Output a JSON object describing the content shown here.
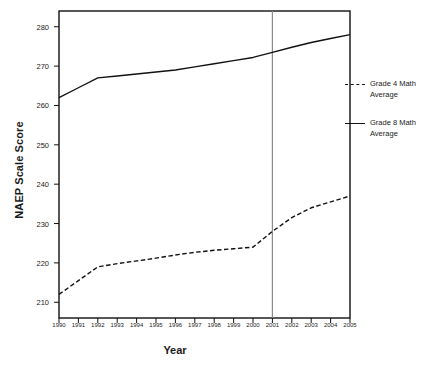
{
  "chart_data": {
    "type": "line",
    "title": "",
    "xlabel": "Year",
    "ylabel": "NAEP Scale Score",
    "x": [
      1990,
      1991,
      1992,
      1993,
      1994,
      1995,
      1996,
      1997,
      1998,
      1999,
      2000,
      2001,
      2002,
      2003,
      2004,
      2005
    ],
    "categories": [
      "1990",
      "1991",
      "1992",
      "1993",
      "1994",
      "1995",
      "1996",
      "1997",
      "1998",
      "1999",
      "2000",
      "2001",
      "2002",
      "2003",
      "2004",
      "2005"
    ],
    "xlim": [
      1990,
      2005
    ],
    "ylim": [
      206,
      284
    ],
    "yticks": [
      210,
      220,
      230,
      240,
      250,
      260,
      270,
      280
    ],
    "ytick_labels": [
      "210",
      "220",
      "230",
      "240",
      "250",
      "260",
      "270",
      "280"
    ],
    "grid": false,
    "legend_position": "right",
    "series": [
      {
        "name": "Grade 4 Math Average",
        "style": "dashed",
        "color": "#111111",
        "values": [
          212,
          215.5,
          219,
          219.8,
          220.5,
          221.2,
          222,
          222.7,
          223.2,
          223.6,
          224,
          228,
          231.5,
          234,
          235.5,
          237
        ]
      },
      {
        "name": "Grade 8 Math Average",
        "style": "solid",
        "color": "#111111",
        "values": [
          262,
          264.5,
          267,
          267.5,
          268,
          268.5,
          269,
          269.8,
          270.6,
          271.4,
          272.2,
          273.5,
          274.8,
          276,
          277,
          278
        ]
      }
    ],
    "annotations": [
      {
        "type": "vertical-line",
        "at_x": 2001,
        "color": "#8c8c8c",
        "label": ""
      }
    ]
  },
  "legend": {
    "items": [
      {
        "label_line1": "Grade 4 Math",
        "label_line2": "Average",
        "style": "dashed"
      },
      {
        "label_line1": "Grade 8 Math",
        "label_line2": "Average",
        "style": "solid"
      }
    ]
  }
}
